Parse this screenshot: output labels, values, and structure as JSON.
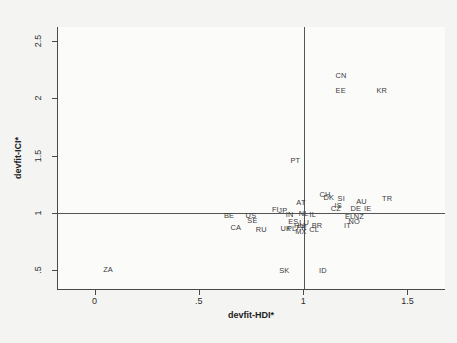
{
  "chart_data": {
    "type": "scatter",
    "title": "",
    "xlabel": "devfit-HDI*",
    "ylabel": "devfit-ICI*",
    "xlim": [
      -0.18,
      1.68
    ],
    "ylim": [
      0.33,
      2.62
    ],
    "xticks": [
      0,
      0.5,
      1,
      1.5
    ],
    "xticklabels": [
      "0",
      ".5",
      "1",
      "1.5"
    ],
    "yticks": [
      0.5,
      1,
      1.5,
      2,
      2.5
    ],
    "yticklabels": [
      ".5",
      "1",
      "1.5",
      "2",
      "2.5"
    ],
    "grid": false,
    "legend": null,
    "marker_style": "text-labels",
    "reference_lines": [
      {
        "axis": "y",
        "value": 1
      },
      {
        "axis": "x",
        "value": 1
      }
    ],
    "points": [
      {
        "label": "CN",
        "x": 1.177,
        "y": 2.205
      },
      {
        "label": "EE",
        "x": 1.175,
        "y": 2.075
      },
      {
        "label": "KR",
        "x": 1.372,
        "y": 2.075
      },
      {
        "label": "PT",
        "x": 0.958,
        "y": 1.463
      },
      {
        "label": "AT",
        "x": 0.985,
        "y": 1.1
      },
      {
        "label": "CH",
        "x": 1.1,
        "y": 1.163
      },
      {
        "label": "DK",
        "x": 1.118,
        "y": 1.138
      },
      {
        "label": "SI",
        "x": 1.178,
        "y": 1.135
      },
      {
        "label": "AU",
        "x": 1.275,
        "y": 1.102
      },
      {
        "label": "TR",
        "x": 1.398,
        "y": 1.133
      },
      {
        "label": "IS",
        "x": 1.163,
        "y": 1.07
      },
      {
        "label": "CZ",
        "x": 1.152,
        "y": 1.048
      },
      {
        "label": "DE",
        "x": 1.248,
        "y": 1.042
      },
      {
        "label": "IE",
        "x": 1.305,
        "y": 1.045
      },
      {
        "label": "FI",
        "x": 0.862,
        "y": 1.032
      },
      {
        "label": "JP",
        "x": 0.898,
        "y": 1.025
      },
      {
        "label": "IN",
        "x": 0.93,
        "y": 0.995
      },
      {
        "label": "NL",
        "x": 0.998,
        "y": 1.0
      },
      {
        "label": "IL",
        "x": 1.042,
        "y": 0.99
      },
      {
        "label": "BE",
        "x": 0.64,
        "y": 0.985
      },
      {
        "label": "US",
        "x": 0.745,
        "y": 0.985
      },
      {
        "label": "EL",
        "x": 1.218,
        "y": 0.972
      },
      {
        "label": "NZ",
        "x": 1.262,
        "y": 0.975
      },
      {
        "label": "SE",
        "x": 0.752,
        "y": 0.938
      },
      {
        "label": "ES",
        "x": 0.948,
        "y": 0.93
      },
      {
        "label": "LU",
        "x": 1.0,
        "y": 0.922
      },
      {
        "label": "NO",
        "x": 1.24,
        "y": 0.93
      },
      {
        "label": "HU",
        "x": 0.978,
        "y": 0.9
      },
      {
        "label": "BR",
        "x": 1.062,
        "y": 0.898
      },
      {
        "label": "IT",
        "x": 1.208,
        "y": 0.895
      },
      {
        "label": "CA",
        "x": 0.672,
        "y": 0.878
      },
      {
        "label": "FR",
        "x": 0.988,
        "y": 0.88
      },
      {
        "label": "UK",
        "x": 0.912,
        "y": 0.872
      },
      {
        "label": "PL",
        "x": 0.94,
        "y": 0.872
      },
      {
        "label": "CL",
        "x": 1.048,
        "y": 0.862
      },
      {
        "label": "RU",
        "x": 0.795,
        "y": 0.858
      },
      {
        "label": "MX",
        "x": 0.985,
        "y": 0.84
      },
      {
        "label": "ZA",
        "x": 0.06,
        "y": 0.51
      },
      {
        "label": "SK",
        "x": 0.905,
        "y": 0.505
      },
      {
        "label": "ID",
        "x": 1.09,
        "y": 0.505
      }
    ]
  }
}
